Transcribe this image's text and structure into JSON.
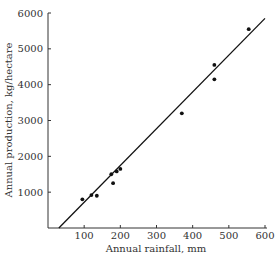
{
  "chart_data": {
    "type": "scatter",
    "title": "",
    "xlabel": "Annual rainfall, mm",
    "ylabel": "Annual production, kg/hectare",
    "xlim": [
      0,
      600
    ],
    "ylim": [
      0,
      6000
    ],
    "xticks": [
      100,
      200,
      300,
      400,
      500,
      600
    ],
    "yticks": [
      1000,
      2000,
      3000,
      4000,
      5000,
      6000
    ],
    "grid": false,
    "legend": null,
    "series": [
      {
        "name": "observations",
        "type": "scatter",
        "x": [
          95,
          120,
          135,
          175,
          180,
          190,
          200,
          370,
          460,
          460,
          555
        ],
        "y": [
          800,
          920,
          900,
          1500,
          1250,
          1580,
          1650,
          3200,
          4150,
          4550,
          5550
        ]
      },
      {
        "name": "fitted line",
        "type": "line",
        "x": [
          30,
          600
        ],
        "y": [
          0,
          5850
        ]
      }
    ]
  },
  "colors": {
    "axis": "#333333",
    "points": "#111111",
    "line": "#111111"
  }
}
